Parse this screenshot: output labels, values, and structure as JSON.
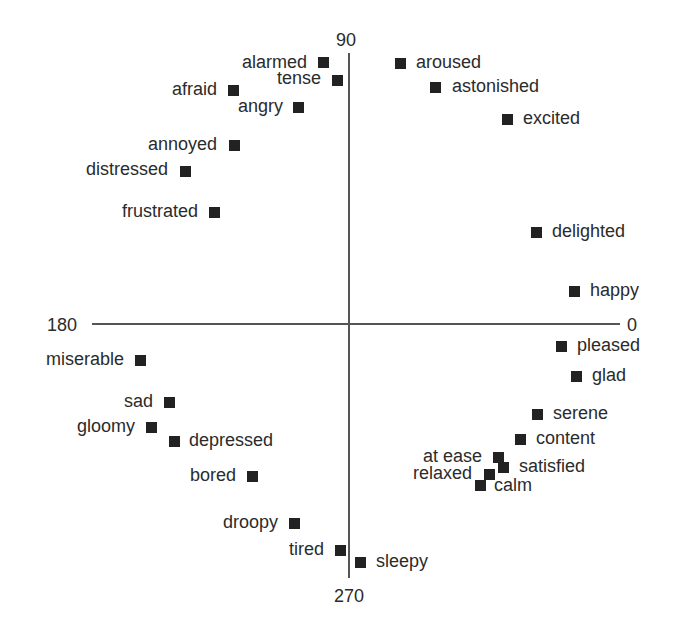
{
  "chart_data": {
    "type": "scatter",
    "title": "",
    "xlabel": "",
    "ylabel": "",
    "grid": false,
    "legend": null,
    "axis_labels": {
      "right": "0",
      "top": "90",
      "left": "180",
      "bottom": "270"
    },
    "xlim": [
      -1,
      1
    ],
    "ylim": [
      -1,
      1
    ],
    "points": [
      {
        "label": "alarmed",
        "x": -0.1,
        "y": 0.96,
        "label_side": "left"
      },
      {
        "label": "tense",
        "x": -0.05,
        "y": 0.89,
        "label_side": "left"
      },
      {
        "label": "afraid",
        "x": -0.44,
        "y": 0.86,
        "label_side": "left"
      },
      {
        "label": "angry",
        "x": -0.2,
        "y": 0.8,
        "label_side": "left"
      },
      {
        "label": "annoyed",
        "x": -0.44,
        "y": 0.66,
        "label_side": "left"
      },
      {
        "label": "distressed",
        "x": -0.62,
        "y": 0.56,
        "label_side": "left"
      },
      {
        "label": "frustrated",
        "x": -0.51,
        "y": 0.41,
        "label_side": "left"
      },
      {
        "label": "aroused",
        "x": 0.19,
        "y": 0.96,
        "label_side": "right"
      },
      {
        "label": "astonished",
        "x": 0.32,
        "y": 0.87,
        "label_side": "right"
      },
      {
        "label": "excited",
        "x": 0.6,
        "y": 0.76,
        "label_side": "right"
      },
      {
        "label": "delighted",
        "x": 0.7,
        "y": 0.34,
        "label_side": "right"
      },
      {
        "label": "happy",
        "x": 0.85,
        "y": 0.12,
        "label_side": "right"
      },
      {
        "label": "pleased",
        "x": 0.8,
        "y": -0.08,
        "label_side": "right"
      },
      {
        "label": "glad",
        "x": 0.86,
        "y": -0.19,
        "label_side": "right"
      },
      {
        "label": "serene",
        "x": 0.71,
        "y": -0.35,
        "label_side": "right"
      },
      {
        "label": "content",
        "x": 0.64,
        "y": -0.45,
        "label_side": "right"
      },
      {
        "label": "at ease",
        "x": 0.56,
        "y": -0.52,
        "label_side": "left"
      },
      {
        "label": "satisfied",
        "x": 0.58,
        "y": -0.56,
        "label_side": "right"
      },
      {
        "label": "relaxed",
        "x": 0.52,
        "y": -0.59,
        "label_side": "left"
      },
      {
        "label": "calm",
        "x": 0.49,
        "y": -0.64,
        "label_side": "right"
      },
      {
        "label": "miserable",
        "x": -0.79,
        "y": -0.15,
        "label_side": "left"
      },
      {
        "label": "sad",
        "x": -0.68,
        "y": -0.31,
        "label_side": "left"
      },
      {
        "label": "gloomy",
        "x": -0.75,
        "y": -0.41,
        "label_side": "left"
      },
      {
        "label": "depressed",
        "x": -0.67,
        "y": -0.46,
        "label_side": "right"
      },
      {
        "label": "bored",
        "x": -0.37,
        "y": -0.59,
        "label_side": "left"
      },
      {
        "label": "droopy",
        "x": -0.21,
        "y": -0.79,
        "label_side": "left"
      },
      {
        "label": "tired",
        "x": -0.04,
        "y": -0.89,
        "label_side": "left"
      },
      {
        "label": "sleepy",
        "x": 0.04,
        "y": -0.94,
        "label_side": "right"
      }
    ]
  },
  "render": {
    "origin": [
      349,
      324
    ],
    "h_axis": {
      "x1": 92,
      "x2": 620
    },
    "v_axis": {
      "y1": 53,
      "y2": 578
    },
    "pixel_points": [
      {
        "label": "alarmed",
        "cx": 323,
        "cy": 62,
        "side": "left",
        "lx": 307,
        "ly": 62
      },
      {
        "label": "tense",
        "cx": 337,
        "cy": 80,
        "side": "left",
        "lx": 321,
        "ly": 78
      },
      {
        "label": "afraid",
        "cx": 233,
        "cy": 90,
        "side": "left",
        "lx": 217,
        "ly": 89
      },
      {
        "label": "angry",
        "cx": 298,
        "cy": 107,
        "side": "left",
        "lx": 283,
        "ly": 106
      },
      {
        "label": "annoyed",
        "cx": 234,
        "cy": 145,
        "side": "left",
        "lx": 217,
        "ly": 144
      },
      {
        "label": "distressed",
        "cx": 185,
        "cy": 171,
        "side": "left",
        "lx": 168,
        "ly": 169
      },
      {
        "label": "frustrated",
        "cx": 214,
        "cy": 212,
        "side": "left",
        "lx": 198,
        "ly": 211
      },
      {
        "label": "aroused",
        "cx": 400,
        "cy": 63,
        "side": "right",
        "lx": 416,
        "ly": 62
      },
      {
        "label": "astonished",
        "cx": 435,
        "cy": 87,
        "side": "right",
        "lx": 452,
        "ly": 86
      },
      {
        "label": "excited",
        "cx": 507,
        "cy": 119,
        "side": "right",
        "lx": 523,
        "ly": 118
      },
      {
        "label": "delighted",
        "cx": 536,
        "cy": 232,
        "side": "right",
        "lx": 552,
        "ly": 231
      },
      {
        "label": "happy",
        "cx": 574,
        "cy": 291,
        "side": "right",
        "lx": 590,
        "ly": 290
      },
      {
        "label": "pleased",
        "cx": 561,
        "cy": 346,
        "side": "right",
        "lx": 577,
        "ly": 345
      },
      {
        "label": "glad",
        "cx": 576,
        "cy": 376,
        "side": "right",
        "lx": 592,
        "ly": 375
      },
      {
        "label": "serene",
        "cx": 537,
        "cy": 414,
        "side": "right",
        "lx": 553,
        "ly": 413
      },
      {
        "label": "content",
        "cx": 520,
        "cy": 439,
        "side": "right",
        "lx": 536,
        "ly": 438
      },
      {
        "label": "at ease",
        "cx": 498,
        "cy": 457,
        "side": "left",
        "lx": 482,
        "ly": 456
      },
      {
        "label": "satisfied",
        "cx": 503,
        "cy": 467,
        "side": "right",
        "lx": 519,
        "ly": 466
      },
      {
        "label": "relaxed",
        "cx": 489,
        "cy": 474,
        "side": "left",
        "lx": 472,
        "ly": 473
      },
      {
        "label": "calm",
        "cx": 480,
        "cy": 485,
        "side": "right",
        "lx": 494,
        "ly": 485
      },
      {
        "label": "miserable",
        "cx": 140,
        "cy": 360,
        "side": "left",
        "lx": 124,
        "ly": 359
      },
      {
        "label": "sad",
        "cx": 169,
        "cy": 402,
        "side": "left",
        "lx": 153,
        "ly": 401
      },
      {
        "label": "gloomy",
        "cx": 151,
        "cy": 427,
        "side": "left",
        "lx": 135,
        "ly": 426
      },
      {
        "label": "depressed",
        "cx": 174,
        "cy": 441,
        "side": "right",
        "lx": 189,
        "ly": 440
      },
      {
        "label": "bored",
        "cx": 252,
        "cy": 476,
        "side": "left",
        "lx": 236,
        "ly": 475
      },
      {
        "label": "droopy",
        "cx": 294,
        "cy": 523,
        "side": "left",
        "lx": 278,
        "ly": 522
      },
      {
        "label": "tired",
        "cx": 340,
        "cy": 550,
        "side": "left",
        "lx": 324,
        "ly": 549
      },
      {
        "label": "sleepy",
        "cx": 360,
        "cy": 562,
        "side": "right",
        "lx": 376,
        "ly": 561
      }
    ]
  }
}
